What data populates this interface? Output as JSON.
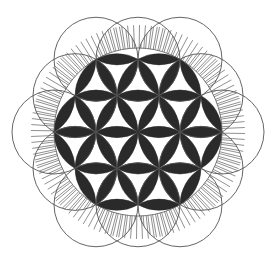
{
  "diagram": {
    "center": [
      138,
      132
    ],
    "radius": 42,
    "colors": {
      "background": "#ffffff",
      "petal_fill": "#2a2a2a",
      "line": "#555555",
      "hatch": "#444444"
    }
  }
}
